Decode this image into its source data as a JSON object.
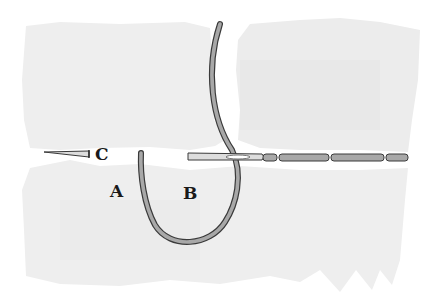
{
  "diagram": {
    "type": "sewing-stitch-illustration",
    "labels": {
      "a": "A",
      "b": "B",
      "c": "C"
    },
    "colors": {
      "background": "#ffffff",
      "fabric": "#efefef",
      "fabric_shade": "#e6e6e6",
      "thread": "#a8a8a8",
      "thread_outline": "#3a3a3a",
      "label": "#1a1a1a"
    },
    "elements": [
      "upper-left-fabric",
      "upper-right-fabric",
      "lower-fabric",
      "thread-loop",
      "needle-c",
      "needle-b",
      "stitch-line"
    ]
  }
}
